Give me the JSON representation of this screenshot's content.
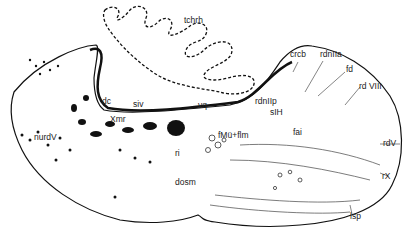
{
  "figure": {
    "type": "brain cross-section diagram",
    "colors": {
      "ink": "#111111",
      "background": "#ffffff"
    }
  },
  "labels": {
    "tchrh": "tchrh",
    "crcb": "crcb",
    "rdnIIa": "rdnIIa",
    "fd": "fd",
    "rdVIII": "rd VIII",
    "dc": "dc",
    "siv": "siv",
    "vq": "vq",
    "rdnIIp": "rdnIIp",
    "sIH": "sIH",
    "Xmr": "Xmr",
    "nurdV": "nurdV",
    "ri": "ri",
    "fMuflm": "fMü+flm",
    "fai": "fai",
    "rdV": "rdV",
    "dosm": "dosm",
    "rX": "rX",
    "lsp": "lsp"
  }
}
